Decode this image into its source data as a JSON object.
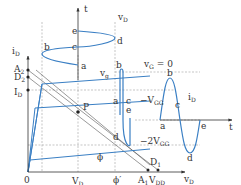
{
  "diagram": {
    "colors": {
      "curve": "#3a7fc4",
      "axis": "#333333",
      "dash": "#999999",
      "loadline": "#555555"
    },
    "axes": {
      "id_axis": {
        "label": "i",
        "sub": "D"
      },
      "vd_axis": {
        "label": "v",
        "sub": "D"
      },
      "t_top": {
        "label": "t"
      },
      "t_right": {
        "label": "t"
      }
    },
    "labels": {
      "origin": "0",
      "A2": {
        "main": "A",
        "sub": "2"
      },
      "D2": {
        "main": "D",
        "sub": "2"
      },
      "ID": {
        "main": "I",
        "sub": "D"
      },
      "VD": {
        "main": "V",
        "sub": "D"
      },
      "A1": {
        "main": "A",
        "sub": "1"
      },
      "VDD": {
        "main": "V",
        "sub": "DD"
      },
      "D1": {
        "main": "D",
        "sub": "1"
      },
      "P": "P",
      "phi": "ϕ",
      "phi_prime": "ϕ′",
      "vg_label": {
        "main": "v",
        "sub": "g"
      },
      "vG0": {
        "main": "v",
        "sub": "G",
        "rest": " = 0"
      },
      "mVGG": {
        "pre": "−V",
        "sub": "GG"
      },
      "m2VGG": {
        "pre": "−2V",
        "sub": "GG"
      },
      "vD_wave": {
        "main": "v",
        "sub": "D"
      },
      "iD_wave": {
        "main": "i",
        "sub": "D"
      }
    },
    "points_top_wave": [
      "e",
      "c",
      "d",
      "b",
      "a"
    ],
    "points_mid_wave": [
      "b",
      "a",
      "c",
      "e",
      "d"
    ],
    "points_right_wave": [
      "b",
      "c",
      "a",
      "e",
      "d"
    ]
  }
}
